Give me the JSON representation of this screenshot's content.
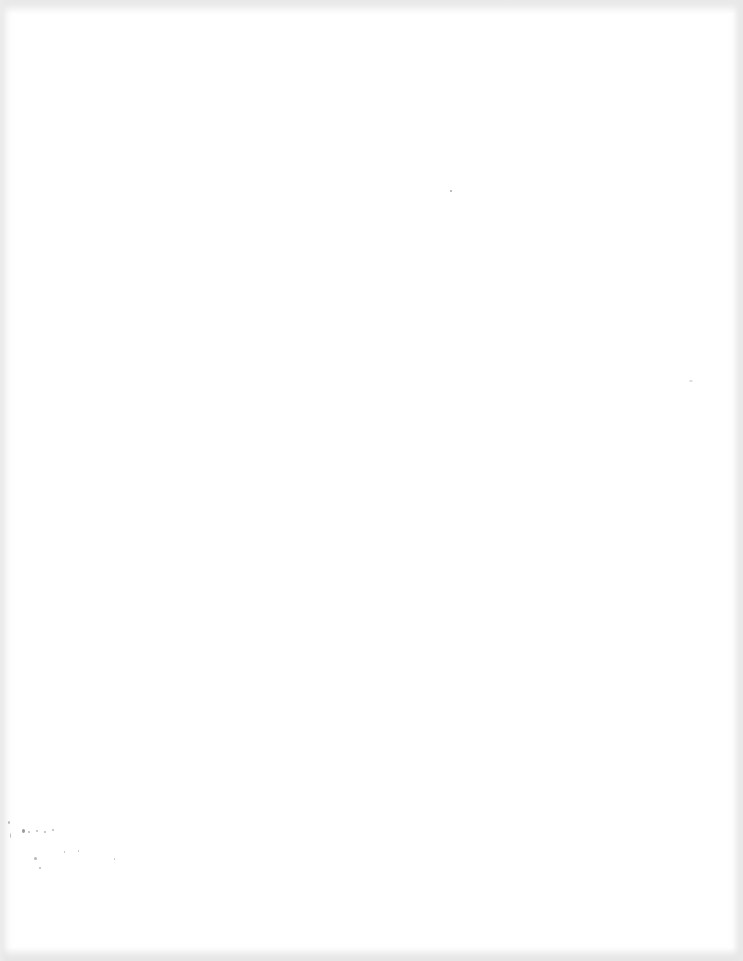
{
  "document": {
    "type": "blank scanned page",
    "content": "",
    "illegible_marks_note": ""
  }
}
